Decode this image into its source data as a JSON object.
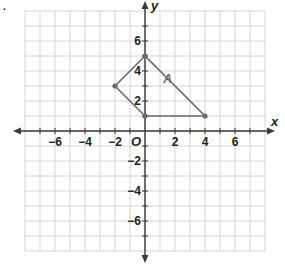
{
  "bullet": ".",
  "chart_data": {
    "type": "scatter",
    "title": "",
    "xlabel": "x",
    "ylabel": "y",
    "xlim": [
      -8,
      8
    ],
    "ylim": [
      -8,
      8
    ],
    "grid": true,
    "origin_label": "O",
    "x_ticks": [
      -6,
      -4,
      -2,
      2,
      4,
      6
    ],
    "x_tick_labels": [
      "−6",
      "−4",
      "−2",
      "2",
      "4",
      "6"
    ],
    "y_ticks": [
      -6,
      -4,
      -2,
      2,
      4,
      6
    ],
    "y_tick_labels": [
      "−6",
      "−4",
      "−2",
      "2",
      "4",
      "6"
    ],
    "shapes": [
      {
        "name": "A",
        "label": "A",
        "label_position": [
          1.5,
          3.5
        ],
        "vertices": [
          [
            0,
            5
          ],
          [
            -2,
            3
          ],
          [
            0,
            1
          ],
          [
            4,
            1
          ]
        ],
        "color": "#6b6b6b"
      }
    ]
  }
}
